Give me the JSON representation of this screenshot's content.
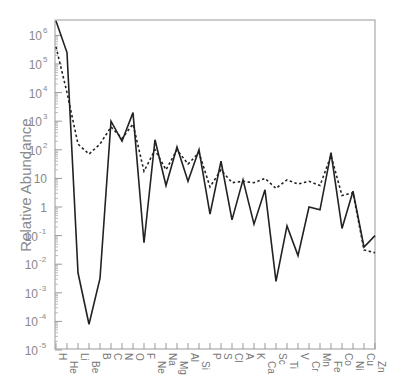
{
  "chart_data": {
    "type": "line",
    "title": "",
    "xlabel": "",
    "ylabel": "Relative Abundance",
    "yscale": "log",
    "ylim_log10": [
      -5,
      6.6
    ],
    "grid": false,
    "legend": null,
    "categories": [
      "H",
      "He",
      "Li",
      "Be",
      "B",
      "C",
      "N",
      "O",
      "F",
      "Ne",
      "Na",
      "Mg",
      "Al",
      "Si",
      "P",
      "S",
      "Cl",
      "A",
      "K",
      "Ca",
      "Sc",
      "Ti",
      "V",
      "Cr",
      "Mn",
      "Fe",
      "Co",
      "Ni",
      "Cu",
      "Zn"
    ],
    "y_ticks": [
      {
        "log": 6,
        "base": "10",
        "exp": "6"
      },
      {
        "log": 5,
        "base": "10",
        "exp": "5"
      },
      {
        "log": 4,
        "base": "10",
        "exp": "4"
      },
      {
        "log": 3,
        "base": "10",
        "exp": "3"
      },
      {
        "log": 2,
        "base": "10",
        "exp": "2"
      },
      {
        "log": 1,
        "base": "10",
        "exp": ""
      },
      {
        "log": 0,
        "base": "1",
        "exp": ""
      },
      {
        "log": -1,
        "base": "10",
        "exp": "-1"
      },
      {
        "log": -2,
        "base": "10",
        "exp": "-2"
      },
      {
        "log": -3,
        "base": "10",
        "exp": "-3"
      },
      {
        "log": -4,
        "base": "10",
        "exp": "-4"
      },
      {
        "log": -5,
        "base": "10",
        "exp": "-5"
      }
    ],
    "series": [
      {
        "name": "solid",
        "style": "solid",
        "color": "#222222",
        "log10_values": [
          6.5,
          5.4,
          -2.3,
          -4.1,
          -2.5,
          3.0,
          2.3,
          3.3,
          -1.25,
          2.35,
          0.75,
          2.1,
          0.9,
          2.0,
          -0.25,
          1.6,
          -0.45,
          0.95,
          -0.6,
          0.6,
          -2.6,
          -0.66,
          -1.7,
          0.0,
          -0.1,
          1.9,
          -0.75,
          0.55,
          -1.4,
          -1.0
        ]
      },
      {
        "name": "dotted",
        "style": "dotted",
        "color": "#222222",
        "log10_values": [
          5.6,
          4.0,
          2.2,
          1.85,
          2.2,
          2.8,
          2.4,
          2.9,
          1.25,
          2.0,
          1.3,
          2.0,
          1.5,
          1.9,
          0.7,
          1.3,
          0.85,
          0.9,
          0.85,
          1.0,
          0.65,
          0.95,
          0.8,
          0.9,
          0.75,
          1.8,
          0.4,
          0.5,
          -1.5,
          -1.6
        ]
      }
    ]
  }
}
